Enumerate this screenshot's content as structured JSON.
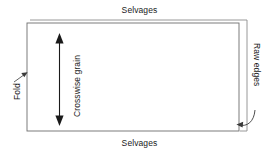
{
  "diagram": {
    "line_color": "#4a4a4a",
    "arrow_color": "#1a1a1a",
    "background": "#ffffff",
    "labels": {
      "selvages_top": "Selvages",
      "selvages_bottom": "Selvages",
      "fold": "Fold",
      "crosswise_grain": "Crosswise grain",
      "raw_edges": "Raw edges"
    },
    "icons": {
      "crosswise_arrow": "double-headed-vertical-arrow",
      "fold_pointer": "short-diagonal-arrow",
      "raw_edges_pointer": "curved-left-arrow"
    },
    "shapes": {
      "front_layer": "rectangle",
      "back_layer": "rectangle-offset-up-right"
    }
  }
}
